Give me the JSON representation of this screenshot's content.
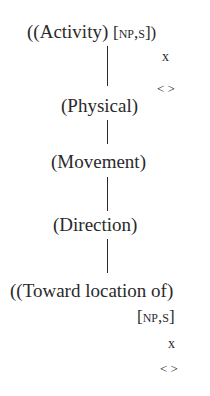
{
  "diagram": {
    "nodes": [
      {
        "id": "activity",
        "label": "((Activity)",
        "feature": "[np,s])"
      },
      {
        "id": "physical",
        "label": "(Physical)"
      },
      {
        "id": "movement",
        "label": "(Movement)"
      },
      {
        "id": "direction",
        "label": "(Direction)"
      },
      {
        "id": "toward",
        "label": "((Toward location of)",
        "feature": "[np,s]"
      }
    ],
    "annotations": {
      "x_top": "x",
      "angle_top": "< >",
      "x_bottom": "x",
      "angle_bottom": "< >"
    },
    "edges": [
      {
        "from": "activity",
        "to": "physical"
      },
      {
        "from": "physical",
        "to": "movement"
      },
      {
        "from": "movement",
        "to": "direction"
      },
      {
        "from": "direction",
        "to": "toward"
      }
    ]
  }
}
